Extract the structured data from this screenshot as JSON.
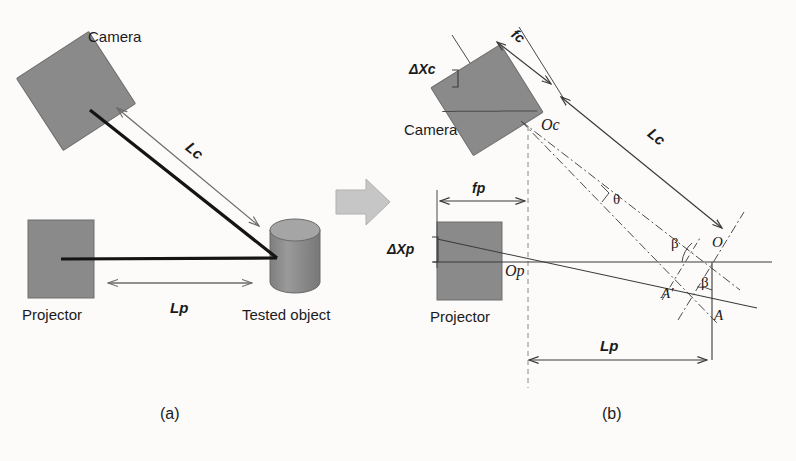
{
  "figure": {
    "background_color": "#fcfbfa",
    "device_fill": "#8a8a8a",
    "line_color": "#1a1a1a",
    "dim_arrow_color": "#6b6b6b",
    "transition_arrow_color": "#bdbdbd"
  },
  "panel_a": {
    "caption": "(a)",
    "camera_label": "Camera",
    "projector_label": "Projector",
    "object_label": "Tested object",
    "lc_label": "Lc",
    "lp_label": "Lp"
  },
  "panel_b": {
    "caption": "(b)",
    "camera_label": "Camera",
    "projector_label": "Projector",
    "fc_label": "fc",
    "fp_label": "fp",
    "delta_xc_label": "ΔXc",
    "delta_xp_label": "ΔXp",
    "lc_label": "Lc",
    "lp_label": "Lp",
    "oc_label": "Oc",
    "op_label": "Op",
    "theta_label": "θ",
    "beta_upper_label": "β",
    "beta_lower_label": "β",
    "point_o_label": "O",
    "point_a_label": "A",
    "point_a_prime_label": "A′"
  },
  "icons": {
    "transition_arrow": "right-arrow-icon",
    "camera_box": "camera-box-icon",
    "projector_box": "projector-box-icon",
    "cylinder": "cylinder-object-icon"
  }
}
